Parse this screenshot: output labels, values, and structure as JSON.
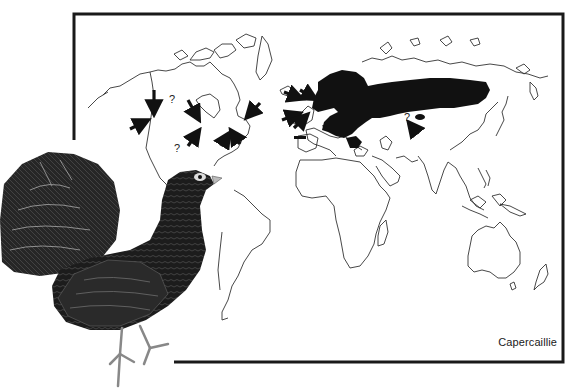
{
  "figure": {
    "caption": "Capercaillie",
    "colors": {
      "frame": "#1a1a1a",
      "coastline": "#333333",
      "range_fill": "#111111",
      "background": "#ffffff"
    },
    "map": {
      "type": "world-outline-map",
      "native_range_region": "Northern Eurasia (Scandinavia to eastern Siberia)",
      "question_marks": [
        "?",
        "?",
        "?"
      ],
      "introduction_arrows_count": 16
    },
    "illustration": {
      "description": "male-capercaillie-displaying"
    }
  }
}
